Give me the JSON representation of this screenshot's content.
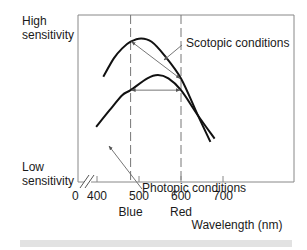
{
  "chart_data": {
    "type": "line",
    "title": "",
    "xlabel": "Wavelength (nm)",
    "ylabel_high": "High sensitivity",
    "ylabel_low": "Low sensitivity",
    "x_ticks": [
      400,
      500,
      600,
      700
    ],
    "x_origin_label": "0",
    "x_axis_break": true,
    "xlim": [
      375,
      800
    ],
    "ylim": [
      0,
      1
    ],
    "color_labels": [
      {
        "text": "Blue",
        "x": 480
      },
      {
        "text": "Red",
        "x": 600
      }
    ],
    "reference_lines": [
      {
        "x": 480,
        "style": "dashed"
      },
      {
        "x": 600,
        "style": "dashed"
      }
    ],
    "series": [
      {
        "name": "Scotopic conditions",
        "points": [
          [
            415,
            0.63
          ],
          [
            440,
            0.74
          ],
          [
            460,
            0.8
          ],
          [
            480,
            0.84
          ],
          [
            505,
            0.86
          ],
          [
            530,
            0.84
          ],
          [
            560,
            0.76
          ],
          [
            600,
            0.62
          ],
          [
            640,
            0.4
          ],
          [
            670,
            0.24
          ]
        ]
      },
      {
        "name": "Photopic conditions",
        "points": [
          [
            398,
            0.33
          ],
          [
            430,
            0.43
          ],
          [
            460,
            0.52
          ],
          [
            480,
            0.55
          ],
          [
            520,
            0.62
          ],
          [
            545,
            0.64
          ],
          [
            570,
            0.62
          ],
          [
            600,
            0.55
          ],
          [
            640,
            0.4
          ],
          [
            680,
            0.26
          ]
        ]
      }
    ],
    "annotations": [
      {
        "text": "Scotopic conditions",
        "target_series": "Scotopic conditions"
      },
      {
        "text": "Photopic conditions",
        "target_series": "Photopic conditions"
      },
      {
        "type": "double-arrow",
        "description": "Scotopic sensitivity difference between 480 nm and 600 nm",
        "from": [
          480,
          0.84
        ],
        "to": [
          600,
          0.62
        ]
      },
      {
        "type": "double-arrow",
        "description": "Photopic equal sensitivity at 480 nm and 600 nm",
        "from": [
          480,
          0.55
        ],
        "to": [
          600,
          0.55
        ]
      }
    ],
    "grid": false,
    "legend": "none"
  }
}
